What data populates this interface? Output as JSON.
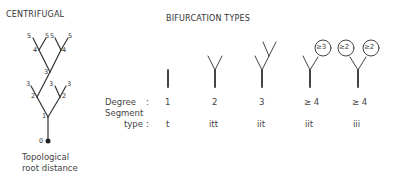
{
  "left": {
    "title": "CENTRIFUGAL",
    "caption_line1": "Topological",
    "caption_line2": "root distance",
    "node_labels": {
      "root": "0",
      "n1": "1",
      "n2l": "2",
      "n2r": "2",
      "l3a": "3",
      "n3": "3",
      "l3b": "3",
      "l3c": "3",
      "n4l": "4",
      "n4r": "4",
      "l5a": "5",
      "l5b": "5",
      "l5c": "5",
      "l5d": "5"
    }
  },
  "right": {
    "title": "BIFURCATION TYPES",
    "row_labels": {
      "degree": "Degree",
      "degree_colon": ":",
      "segment": "Segment",
      "type": "type",
      "type_colon": ":"
    },
    "types": [
      {
        "degree": "1",
        "segment_type": "t"
      },
      {
        "degree": "2",
        "segment_type": "itt"
      },
      {
        "degree": "3",
        "segment_type": "iit"
      },
      {
        "degree": "≥ 4",
        "segment_type": "iit",
        "circles": [
          "≥3"
        ]
      },
      {
        "degree": "≥ 4",
        "segment_type": "iii",
        "circles": [
          "≥2",
          "≥2"
        ]
      }
    ]
  }
}
